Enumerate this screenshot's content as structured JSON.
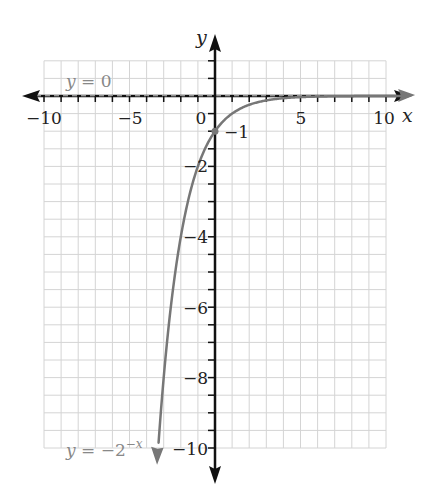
{
  "chart_data": {
    "type": "line",
    "title": "",
    "xlabel": "x",
    "ylabel": "y",
    "xlim": [
      -10,
      10
    ],
    "ylim": [
      -10,
      1
    ],
    "grid": true,
    "grid_step": 0.5,
    "x_ticks": [
      -10,
      -5,
      0,
      5,
      10
    ],
    "x_tick_labels": [
      "−10",
      "−5",
      "0",
      "5",
      "10"
    ],
    "y_ticks": [
      -1,
      -2,
      -4,
      -6,
      -8,
      -10
    ],
    "y_tick_labels": [
      "−1",
      "−2",
      "−4",
      "−6",
      "−8",
      "−10"
    ],
    "series": [
      {
        "name": "y = −2^(−x)",
        "function": "-2^(-x)",
        "color": "#777777",
        "x": [
          -3.3,
          -3,
          -2.5,
          -2,
          -1.5,
          -1,
          -0.5,
          0,
          1,
          2,
          3,
          4,
          5,
          6,
          7,
          8,
          9,
          10,
          11
        ],
        "y": [
          -9.85,
          -8,
          -5.66,
          -4,
          -2.83,
          -2,
          -1.41,
          -1,
          -0.5,
          -0.25,
          -0.125,
          -0.0625,
          -0.031,
          -0.016,
          -0.008,
          -0.004,
          -0.002,
          -0.001,
          -0.0005
        ],
        "arrow_ends": true
      },
      {
        "name": "y = 0",
        "function": "0",
        "style": "dashed",
        "color": "#333333",
        "note": "horizontal asymptote"
      }
    ],
    "annotations": [
      {
        "text": "y = 0",
        "x": -8.5,
        "y": 0.4
      },
      {
        "text": "y = −2^(−x)",
        "x": -8.5,
        "y": -10
      },
      {
        "text": "−1",
        "x": 0.7,
        "y": -1,
        "note": "y-intercept point"
      }
    ],
    "points": [
      {
        "x": 0,
        "y": -1,
        "label": "(0, −1)"
      }
    ]
  },
  "labels": {
    "x_axis": "x",
    "y_axis": "y",
    "asymptote_eq_var": "y",
    "asymptote_eq_rest": " = 0",
    "curve_eq_var": "y",
    "curve_eq_rest": " = −2",
    "curve_eq_exp": "−x",
    "intercept": "−1",
    "x_ticks": [
      "−10",
      "−5",
      "0",
      "5",
      "10"
    ],
    "y_ticks": [
      "−2",
      "−4",
      "−6",
      "−8",
      "−10"
    ]
  },
  "colors": {
    "grid": "#d4d4d4",
    "axis": "#111111",
    "curve": "#777777",
    "label_gray": "#888888"
  }
}
